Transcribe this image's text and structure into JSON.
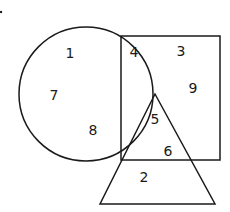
{
  "diagram": {
    "type": "venn",
    "shapes": [
      {
        "name": "circle",
        "cx": 86,
        "cy": 94,
        "r": 67
      },
      {
        "name": "square",
        "x": 121,
        "y": 36,
        "width": 99,
        "height": 124
      },
      {
        "name": "triangle",
        "points": [
          [
            155,
            94
          ],
          [
            100,
            204
          ],
          [
            215,
            204
          ]
        ]
      }
    ],
    "regions": [
      {
        "label": "1",
        "x": 70,
        "y": 54,
        "in": [
          "circle"
        ]
      },
      {
        "label": "7",
        "x": 54,
        "y": 96,
        "in": [
          "circle"
        ]
      },
      {
        "label": "8",
        "x": 93,
        "y": 131,
        "in": [
          "circle"
        ]
      },
      {
        "label": "4",
        "x": 134,
        "y": 53,
        "in": [
          "circle",
          "square"
        ]
      },
      {
        "label": "3",
        "x": 181,
        "y": 52,
        "in": [
          "square"
        ]
      },
      {
        "label": "9",
        "x": 193,
        "y": 89,
        "in": [
          "square"
        ]
      },
      {
        "label": "5",
        "x": 155,
        "y": 120,
        "in": [
          "circle",
          "square",
          "triangle"
        ]
      },
      {
        "label": "6",
        "x": 168,
        "y": 152,
        "in": [
          "triangle"
        ]
      },
      {
        "label": "2",
        "x": 144,
        "y": 178,
        "in": [
          "triangle"
        ]
      }
    ]
  }
}
